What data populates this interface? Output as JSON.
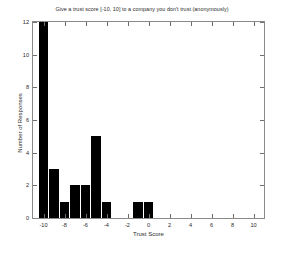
{
  "chart_data": {
    "type": "bar",
    "title": "Give a trust score [-10, 10] to a company you don't trust (anonymously)",
    "xlabel": "Trust Score",
    "ylabel": "Number of Responses",
    "xlim": [
      -11,
      11
    ],
    "ylim": [
      0,
      12
    ],
    "grid": false,
    "legend": null,
    "bar_color": "#000000",
    "x": [
      -10,
      -9,
      -8,
      -7,
      -6,
      -5,
      -4,
      -1,
      0
    ],
    "values": [
      12,
      3,
      1,
      2,
      2,
      5,
      1,
      1,
      1
    ],
    "categories": [
      "-10",
      "-9",
      "-8",
      "-7",
      "-6",
      "-5",
      "-4",
      "-1",
      "0"
    ],
    "note_clipped": "Bar at -10 reaches the top of the axis (12)",
    "xticks": [
      -10,
      -8,
      -6,
      -4,
      -2,
      0,
      2,
      4,
      6,
      8,
      10
    ],
    "xticklabels": [
      "-10",
      "-8",
      "-6",
      "-4",
      "-2",
      "0",
      "2",
      "4",
      "6",
      "8",
      "10"
    ],
    "yticks": [
      0,
      2,
      4,
      6,
      8,
      10,
      12
    ],
    "yticklabels": [
      "0",
      "2",
      "4",
      "6",
      "8",
      "10",
      "12"
    ]
  },
  "figure": {
    "background": "#ffffff",
    "axes_color": "#8a8a8a",
    "text_color": "#2b2b2b",
    "corner_mark": ""
  }
}
